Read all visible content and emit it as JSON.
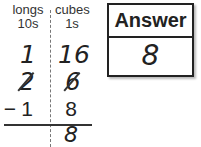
{
  "columns": {
    "tens": {
      "header_line1": "longs",
      "header_line2": "10s"
    },
    "ones": {
      "header_line1": "cubes",
      "header_line2": "1s"
    }
  },
  "rows": {
    "regrouped": {
      "tens": "1",
      "ones": "16"
    },
    "original": {
      "tens": "2",
      "ones": "6",
      "crossed_out": true
    },
    "subtrahend": {
      "sign": "−",
      "tens": "1",
      "ones": "8"
    },
    "difference": {
      "tens": "",
      "ones": "8"
    }
  },
  "answer": {
    "label": "Answer",
    "value": "8"
  }
}
